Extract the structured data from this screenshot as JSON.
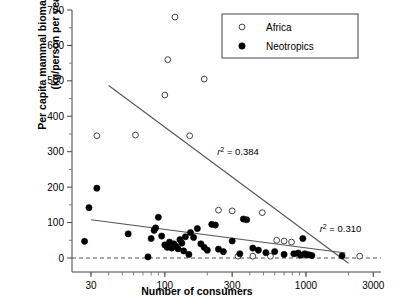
{
  "chart_data": {
    "type": "scatter",
    "title": "",
    "xlabel": "Number of consumers",
    "ylabel_line1": "Per capita mammal biomass harvest",
    "ylabel_line2": "(kg/person per year)",
    "xscale": "log",
    "xlim": [
      22,
      3400
    ],
    "ylim": [
      0,
      700
    ],
    "xticks": [
      30,
      100,
      300,
      1000,
      3000
    ],
    "xtick_labels": [
      "30",
      "100",
      "300",
      "1000",
      "3000"
    ],
    "yticks": [
      0,
      100,
      200,
      300,
      400,
      500,
      600,
      700
    ],
    "ytick_labels": [
      "0",
      "100",
      "200",
      "300",
      "400",
      "500",
      "600",
      "700"
    ],
    "grid": false,
    "zero_line": true,
    "legend": {
      "position": "top-right",
      "entries": [
        {
          "name": "Africa",
          "marker": "open-circle"
        },
        {
          "name": "Neotropics",
          "marker": "filled-circle"
        }
      ]
    },
    "annotations": [
      {
        "text": "r² = 0.384",
        "x": 235,
        "y": 290,
        "series": "Africa"
      },
      {
        "text": "r² = 0.310",
        "x": 1250,
        "y": 72,
        "series": "Neotropics"
      }
    ],
    "series": [
      {
        "name": "Africa",
        "marker": "open-circle",
        "points": [
          [
            33,
            345
          ],
          [
            62,
            347
          ],
          [
            100,
            460
          ],
          [
            105,
            560
          ],
          [
            118,
            680
          ],
          [
            150,
            345
          ],
          [
            190,
            505
          ],
          [
            240,
            135
          ],
          [
            300,
            133
          ],
          [
            330,
            5
          ],
          [
            420,
            5
          ],
          [
            490,
            128
          ],
          [
            560,
            5
          ],
          [
            620,
            50
          ],
          [
            700,
            48
          ],
          [
            790,
            45
          ],
          [
            880,
            10
          ],
          [
            1020,
            8
          ],
          [
            2400,
            5
          ]
        ],
        "regression": {
          "x1": 40,
          "y1": 487,
          "x2": 2000,
          "y2": -15,
          "r2": 0.384
        }
      },
      {
        "name": "Neotropics",
        "marker": "filled-circle",
        "points": [
          [
            27,
            47
          ],
          [
            29,
            142
          ],
          [
            33,
            197
          ],
          [
            55,
            68
          ],
          [
            76,
            3
          ],
          [
            80,
            55
          ],
          [
            84,
            78
          ],
          [
            86,
            85
          ],
          [
            90,
            115
          ],
          [
            95,
            62
          ],
          [
            100,
            37
          ],
          [
            104,
            30
          ],
          [
            108,
            45
          ],
          [
            112,
            28
          ],
          [
            116,
            40
          ],
          [
            120,
            33
          ],
          [
            124,
            26
          ],
          [
            128,
            52
          ],
          [
            132,
            42
          ],
          [
            136,
            20
          ],
          [
            140,
            60
          ],
          [
            148,
            10
          ],
          [
            152,
            72
          ],
          [
            160,
            58
          ],
          [
            170,
            83
          ],
          [
            180,
            40
          ],
          [
            190,
            30
          ],
          [
            200,
            22
          ],
          [
            215,
            95
          ],
          [
            228,
            93
          ],
          [
            240,
            25
          ],
          [
            260,
            18
          ],
          [
            300,
            48
          ],
          [
            340,
            12
          ],
          [
            360,
            110
          ],
          [
            380,
            108
          ],
          [
            420,
            28
          ],
          [
            460,
            22
          ],
          [
            520,
            15
          ],
          [
            600,
            18
          ],
          [
            700,
            10
          ],
          [
            820,
            12
          ],
          [
            880,
            14
          ],
          [
            920,
            8
          ],
          [
            950,
            55
          ],
          [
            980,
            12
          ],
          [
            1000,
            10
          ],
          [
            1050,
            9
          ],
          [
            1100,
            7
          ],
          [
            1800,
            6
          ]
        ],
        "regression": {
          "x1": 30,
          "y1": 108,
          "x2": 1900,
          "y2": 14,
          "r2": 0.31
        }
      }
    ]
  },
  "axis": {
    "xlabel": "Number of consumers",
    "ylabel_line1": "Per capita mammal biomass harvest",
    "ylabel_line2": "(kg/person per year)"
  },
  "legend": {
    "africa_label": "Africa",
    "neotropics_label": "Neotropics"
  },
  "annotations": {
    "africa_r2": "r² = 0.384",
    "neotropics_r2": "r² = 0.310"
  }
}
